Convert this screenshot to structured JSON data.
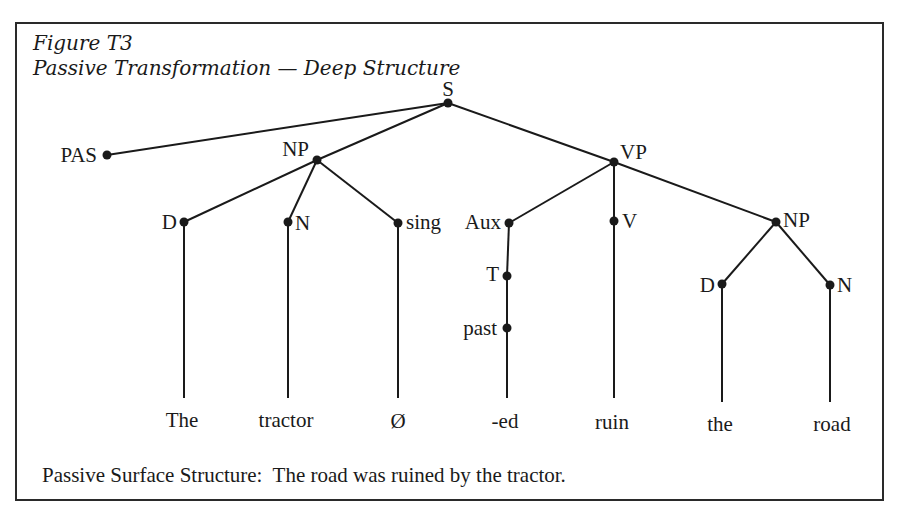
{
  "figure": {
    "label": "Figure T3",
    "title": "Passive Transformation — Deep Structure",
    "caption": "Passive Surface Structure:  The road was ruined by the tractor."
  },
  "tree": {
    "nodes": {
      "S": "S",
      "PAS": "PAS",
      "NP_subject": "NP",
      "VP": "VP",
      "D_subject": "D",
      "N_subject": "N",
      "sing": "sing",
      "Aux": "Aux",
      "V": "V",
      "NP_object": "NP",
      "T": "T",
      "past": "past",
      "D_object": "D",
      "N_object": "N"
    },
    "leaves": {
      "the_subject": "The",
      "tractor": "tractor",
      "null": "Ø",
      "ed": "-ed",
      "ruin": "ruin",
      "the_object": "the",
      "road": "road"
    },
    "edges": [
      [
        "S",
        "PAS"
      ],
      [
        "S",
        "NP_subject"
      ],
      [
        "S",
        "VP"
      ],
      [
        "NP_subject",
        "D_subject"
      ],
      [
        "NP_subject",
        "N_subject"
      ],
      [
        "NP_subject",
        "sing"
      ],
      [
        "VP",
        "Aux"
      ],
      [
        "VP",
        "V"
      ],
      [
        "VP",
        "NP_object"
      ],
      [
        "Aux",
        "T"
      ],
      [
        "T",
        "past"
      ],
      [
        "NP_object",
        "D_object"
      ],
      [
        "NP_object",
        "N_object"
      ],
      [
        "D_subject",
        "The"
      ],
      [
        "N_subject",
        "tractor"
      ],
      [
        "sing",
        "Ø"
      ],
      [
        "past",
        "-ed"
      ],
      [
        "V",
        "ruin"
      ],
      [
        "D_object",
        "the"
      ],
      [
        "N_object",
        "road"
      ]
    ]
  },
  "colors": {
    "ink": "#1a1a1a",
    "background": "#ffffff"
  }
}
